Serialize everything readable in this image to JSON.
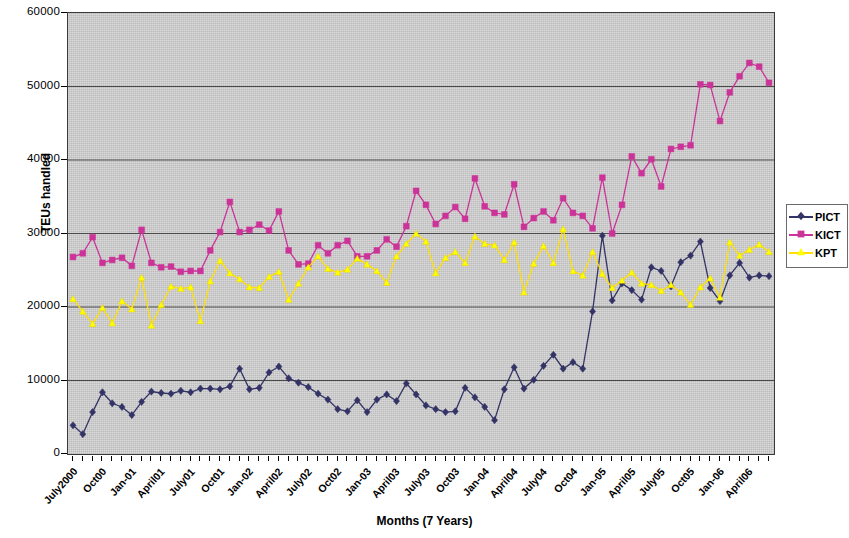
{
  "chart_data": {
    "type": "line",
    "title": "",
    "xlabel": "Months (7 Years)",
    "ylabel": "TEUs handled",
    "ylim": [
      0,
      60000
    ],
    "ytick_labels": [
      "60000",
      "50000",
      "40000",
      "30000",
      "20000",
      "10000",
      "0"
    ],
    "ytick_values": [
      60000,
      50000,
      40000,
      30000,
      20000,
      10000,
      0
    ],
    "grid": true,
    "grid_axis": "y",
    "legend_position": "right",
    "x_tick_count": 72,
    "categories": [
      "July2000",
      "Aug00",
      "Sept00",
      "Oct00",
      "Nov00",
      "Dec00",
      "Jan-01",
      "Feb01",
      "March01",
      "April01",
      "May01",
      "June01",
      "July01",
      "Aug01",
      "Sept01",
      "Oct01",
      "Nov01",
      "Dec01",
      "Jan-02",
      "Feb02",
      "March02",
      "April02",
      "May02",
      "June02",
      "July02",
      "Aug02",
      "Sept02",
      "Oct02",
      "Nov02",
      "Dec02",
      "Jan-03",
      "Feb03",
      "March03",
      "April03",
      "May03",
      "June03",
      "July03",
      "Aug03",
      "Sept03",
      "Oct03",
      "Nov03",
      "Dec03",
      "Jan-04",
      "Feb04",
      "March04",
      "April04",
      "May04",
      "June04",
      "July04",
      "Aug04",
      "Sept04",
      "Oct04",
      "Nov04",
      "Dec04",
      "Jan-05",
      "Feb05",
      "March05",
      "April05",
      "May05",
      "June05",
      "July05",
      "Aug05",
      "Sept05",
      "Oct05",
      "Nov05",
      "Dec05",
      "Jan-06",
      "Feb06",
      "March06",
      "April06",
      "May06",
      "June06"
    ],
    "xtick_labels": [
      {
        "index": 0,
        "label": "July2000"
      },
      {
        "index": 3,
        "label": "Oct00"
      },
      {
        "index": 6,
        "label": "Jan-01"
      },
      {
        "index": 9,
        "label": "April01"
      },
      {
        "index": 12,
        "label": "July01"
      },
      {
        "index": 15,
        "label": "Oct01"
      },
      {
        "index": 18,
        "label": "Jan-02"
      },
      {
        "index": 21,
        "label": "April02"
      },
      {
        "index": 24,
        "label": "July02"
      },
      {
        "index": 27,
        "label": "Oct02"
      },
      {
        "index": 30,
        "label": "Jan-03"
      },
      {
        "index": 33,
        "label": "April03"
      },
      {
        "index": 36,
        "label": "July03"
      },
      {
        "index": 39,
        "label": "Oct03"
      },
      {
        "index": 42,
        "label": "Jan-04"
      },
      {
        "index": 45,
        "label": "April04"
      },
      {
        "index": 48,
        "label": "July04"
      },
      {
        "index": 51,
        "label": "Oct04"
      },
      {
        "index": 54,
        "label": "Jan-05"
      },
      {
        "index": 57,
        "label": "April05"
      },
      {
        "index": 60,
        "label": "July05"
      },
      {
        "index": 63,
        "label": "Oct05"
      },
      {
        "index": 66,
        "label": "Jan-06"
      },
      {
        "index": 69,
        "label": "April06"
      }
    ],
    "series": [
      {
        "name": "PICT",
        "color": "#333366",
        "marker": "diamond",
        "values": [
          3900,
          2700,
          5700,
          8400,
          6900,
          6400,
          5300,
          7100,
          8500,
          8300,
          8200,
          8600,
          8400,
          8900,
          8900,
          8800,
          9200,
          11600,
          8800,
          9000,
          11100,
          11900,
          10300,
          9700,
          9100,
          8200,
          7400,
          6100,
          5800,
          7300,
          5700,
          7400,
          8100,
          7200,
          9600,
          8100,
          6600,
          6100,
          5700,
          5800,
          9000,
          7700,
          6400,
          4600,
          8800,
          11800,
          8900,
          10100,
          12000,
          13500,
          11600,
          12500,
          11600,
          19400,
          29700,
          20900,
          23200,
          22300,
          21000,
          25400,
          24900,
          22800,
          26100,
          27000,
          28900,
          22600,
          20800,
          24300,
          26000,
          24000,
          24300,
          24200
        ]
      },
      {
        "name": "KICT",
        "color": "#CC3399",
        "marker": "square",
        "values": [
          26800,
          27300,
          29500,
          26000,
          26400,
          26700,
          25600,
          30500,
          26000,
          25400,
          25500,
          24800,
          24900,
          24900,
          27700,
          30200,
          34300,
          30200,
          30500,
          31200,
          30400,
          33000,
          27700,
          25800,
          25900,
          28400,
          27300,
          28400,
          29000,
          26900,
          26900,
          27700,
          29200,
          28200,
          31000,
          35800,
          33900,
          31300,
          32400,
          33600,
          32000,
          37500,
          33700,
          32800,
          32600,
          36700,
          30900,
          32100,
          33000,
          31800,
          34800,
          32800,
          32400,
          30700,
          37600,
          30000,
          33900,
          40500,
          38200,
          40100,
          36400,
          41500,
          41800,
          42000,
          50300,
          50200,
          45300,
          49200,
          51400,
          53200,
          52700,
          50500
        ]
      },
      {
        "name": "KPT",
        "color": "#FFFF00",
        "marker": "triangle",
        "values": [
          21100,
          19400,
          17700,
          19900,
          17800,
          20800,
          19700,
          24000,
          17500,
          20300,
          22800,
          22500,
          22700,
          18100,
          23500,
          26300,
          24600,
          23800,
          22700,
          22600,
          24100,
          24800,
          21000,
          23200,
          25400,
          26900,
          25200,
          24700,
          25100,
          26600,
          25800,
          24900,
          23300,
          26900,
          28600,
          30000,
          28900,
          24600,
          26700,
          27500,
          26000,
          29600,
          28600,
          28400,
          26400,
          28800,
          22000,
          25900,
          28300,
          26000,
          30600,
          24900,
          24300,
          27500,
          24500,
          22600,
          23600,
          24700,
          23200,
          23000,
          22200,
          23000,
          22000,
          20300,
          22700,
          23900,
          21300,
          28800,
          27000,
          27800,
          28500,
          27500
        ]
      }
    ]
  },
  "legend": {
    "items": [
      {
        "label": "PICT",
        "color": "#333366",
        "marker": "diamond"
      },
      {
        "label": "KICT",
        "color": "#CC3399",
        "marker": "square"
      },
      {
        "label": "KPT",
        "color": "#FFFF00",
        "marker": "triangle"
      }
    ]
  },
  "axes": {
    "y_title": "TEUs handled",
    "x_title": "Months (7 Years)"
  }
}
